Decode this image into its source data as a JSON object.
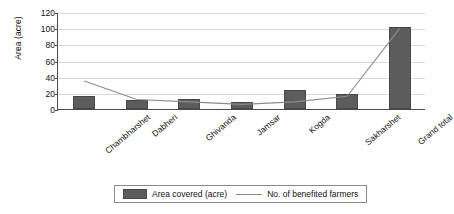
{
  "chart_data": {
    "type": "bar",
    "title": "",
    "xlabel": "",
    "ylabel": "Area (acre)",
    "ylim": [
      0,
      120
    ],
    "ytick_step": 20,
    "yticks": [
      "0",
      "20",
      "40",
      "60",
      "80",
      "100",
      "120"
    ],
    "grid": true,
    "legend_position": "bottom",
    "categories": [
      "Chambharshet",
      "Dabheri",
      "Ghivanda",
      "Jamsar",
      "Kogda",
      "Sakharshet",
      "Grand total"
    ],
    "series": [
      {
        "name": "Area covered (acre)",
        "type": "bar",
        "color": "#5c5c5c",
        "values": [
          16,
          11,
          12,
          9,
          24,
          18,
          101
        ]
      },
      {
        "name": "No. of benefited farmers",
        "type": "line",
        "color": "#8c8c8c",
        "values": [
          36,
          13,
          10,
          7,
          10,
          17,
          101
        ]
      }
    ]
  },
  "legend": {
    "bar_label": "Area covered (acre)",
    "line_label": "No. of benefited farmers"
  }
}
